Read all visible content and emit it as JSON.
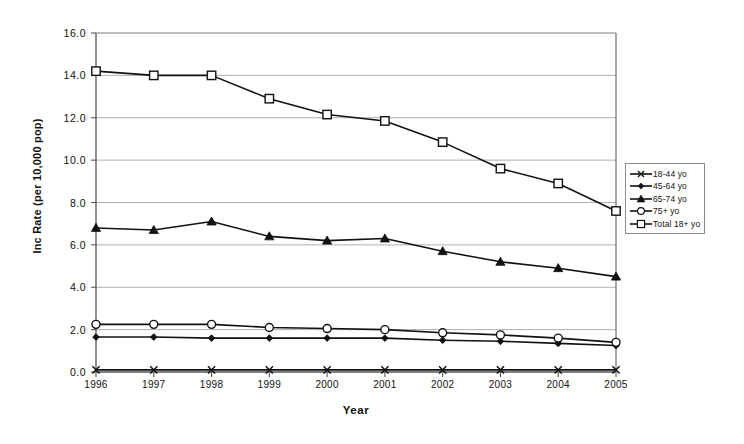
{
  "chart_data": {
    "type": "line",
    "title": "",
    "xlabel": "Year",
    "ylabel": "Inc Rate (per 10,000 pop)",
    "categories": [
      "1996",
      "1997",
      "1998",
      "1999",
      "2000",
      "2001",
      "2002",
      "2003",
      "2004",
      "2005"
    ],
    "x": [
      1996,
      1997,
      1998,
      1999,
      2000,
      2001,
      2002,
      2003,
      2004,
      2005
    ],
    "ylim": [
      0.0,
      16.0
    ],
    "yticks": [
      "0.0",
      "2.0",
      "4.0",
      "6.0",
      "8.0",
      "10.0",
      "12.0",
      "14.0",
      "16.0"
    ],
    "ytick_values": [
      0.0,
      2.0,
      4.0,
      6.0,
      8.0,
      10.0,
      12.0,
      14.0,
      16.0
    ],
    "grid": "horizontal",
    "legend_position": "right",
    "series": [
      {
        "name": "18-44 yo",
        "marker": "x-cross",
        "values": [
          0.1,
          0.1,
          0.1,
          0.1,
          0.1,
          0.1,
          0.1,
          0.1,
          0.1,
          0.1
        ]
      },
      {
        "name": "45-64 yo",
        "marker": "filled-diamond",
        "values": [
          1.65,
          1.65,
          1.6,
          1.6,
          1.6,
          1.6,
          1.5,
          1.45,
          1.35,
          1.25
        ]
      },
      {
        "name": "65-74 yo",
        "marker": "filled-triangle",
        "values": [
          6.8,
          6.7,
          7.1,
          6.4,
          6.2,
          6.3,
          5.7,
          5.2,
          4.9,
          4.5
        ]
      },
      {
        "name": "75+ yo",
        "marker": "open-circle",
        "values": [
          2.25,
          2.25,
          2.25,
          2.1,
          2.05,
          2.0,
          1.85,
          1.75,
          1.6,
          1.4
        ]
      },
      {
        "name": "Total 18+ yo",
        "marker": "open-square",
        "values": [
          14.2,
          14.0,
          14.0,
          12.9,
          12.15,
          11.85,
          10.85,
          9.6,
          8.9,
          7.6
        ]
      }
    ]
  },
  "legend": {
    "entries": [
      {
        "label": "18-44 yo",
        "marker": "x-cross"
      },
      {
        "label": "45-64 yo",
        "marker": "filled-diamond"
      },
      {
        "label": "65-74 yo",
        "marker": "filled-triangle"
      },
      {
        "label": "75+ yo",
        "marker": "open-circle"
      },
      {
        "label": "Total 18+ yo",
        "marker": "open-square"
      }
    ]
  },
  "colors": {
    "line": "#111111",
    "grid": "#999999",
    "axis": "#555555",
    "plot_background": "#ffffff",
    "marker_fill": "#ffffff"
  }
}
